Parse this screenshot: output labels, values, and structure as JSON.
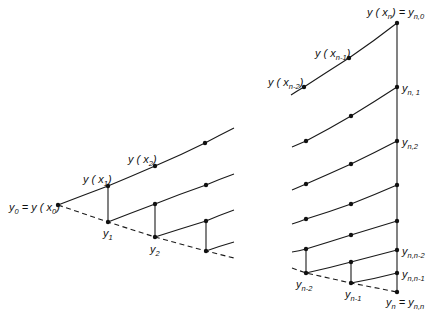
{
  "figure": {
    "left_panel": {
      "labels": {
        "y0_eq": {
          "text": "y",
          "sub": "0",
          "rest": " = y ( x",
          "rest_sub": "0",
          "close": ")"
        },
        "yx1": {
          "text": "y ( x",
          "sub": "1",
          "close": ")"
        },
        "yx2": {
          "text": "y ( x",
          "sub": "2",
          "close": ")"
        },
        "y1": {
          "text": "y",
          "sub": "1"
        },
        "y2": {
          "text": "y",
          "sub": "2"
        }
      }
    },
    "right_panel": {
      "labels": {
        "yxn": {
          "text": "y ( x",
          "sub": "n",
          "close": ") = y",
          "sub2": "n,0"
        },
        "yxn1": {
          "text": "y ( x",
          "sub": "n-1",
          "close": ")"
        },
        "yxn2": {
          "text": "y ( x",
          "sub": "n-2",
          "close": ")"
        },
        "yn1": {
          "text": "y",
          "sub": "n, 1"
        },
        "yn2": {
          "text": "y",
          "sub": "n,2"
        },
        "ynn2": {
          "text": "y",
          "sub": "n,n-2"
        },
        "ynn1": {
          "text": "y",
          "sub": "n,n-1"
        },
        "ym2": {
          "text": "y",
          "sub": "n-2"
        },
        "ym1": {
          "text": "y",
          "sub": "n-1"
        },
        "yn_eq": {
          "text": "y",
          "sub": "n",
          "rest": " = y",
          "rest_sub": "n,n"
        }
      }
    }
  }
}
